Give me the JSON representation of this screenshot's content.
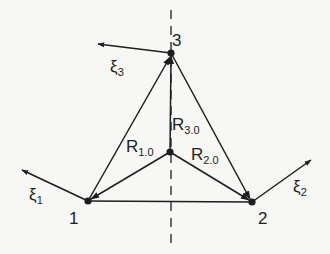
{
  "diagram": {
    "colors": {
      "ink": "#1e1e1e",
      "background": "#f7f7f5"
    },
    "nodes": [
      {
        "id": "1",
        "label": "1",
        "x": 88,
        "y": 201
      },
      {
        "id": "2",
        "label": "2",
        "x": 252,
        "y": 202
      },
      {
        "id": "3",
        "label": "3",
        "x": 171,
        "y": 53
      },
      {
        "id": "0",
        "label": "",
        "x": 170,
        "y": 152
      }
    ],
    "vectors": [
      {
        "id": "R10",
        "base": "R",
        "sub": "1.0",
        "from": "0",
        "to": "1"
      },
      {
        "id": "R20",
        "base": "R",
        "sub": "2.0",
        "from": "0",
        "to": "2"
      },
      {
        "id": "R30",
        "base": "R",
        "sub": "3.0",
        "from": "0",
        "to": "3"
      }
    ],
    "edges": [
      {
        "from": "1",
        "to": "3",
        "arrow": "end"
      },
      {
        "from": "3",
        "to": "2",
        "arrow": "end"
      },
      {
        "from": "1",
        "to": "2",
        "arrow": "none"
      }
    ],
    "displacements": [
      {
        "id": "xi1",
        "base": "ξ",
        "sub": "1",
        "at": "1"
      },
      {
        "id": "xi2",
        "base": "ξ",
        "sub": "2",
        "at": "2"
      },
      {
        "id": "xi3",
        "base": "ξ",
        "sub": "3",
        "at": "3"
      }
    ],
    "symmetry_axis": "dashed vertical line through 0 and 3"
  },
  "labels": {
    "node1": "1",
    "node2": "2",
    "node3": "3",
    "r10_base": "R",
    "r10_sub": "1.0",
    "r20_base": "R",
    "r20_sub": "2.0",
    "r30_base": "R",
    "r30_sub": "3.0",
    "xi1_base": "ξ",
    "xi1_sub": "1",
    "xi2_base": "ξ",
    "xi2_sub": "2",
    "xi3_base": "ξ",
    "xi3_sub": "3"
  }
}
